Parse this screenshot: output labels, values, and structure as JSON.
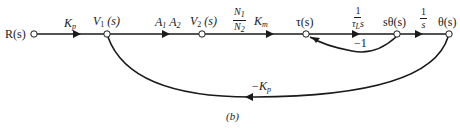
{
  "diagram": {
    "type": "signal-flow-graph",
    "caption": "(b)",
    "nodes": [
      {
        "id": "R",
        "label": "R(s)"
      },
      {
        "id": "V1",
        "label": "V",
        "sub": "1",
        "suffix": " (s)"
      },
      {
        "id": "V2",
        "label": "V",
        "sub": "2",
        "suffix": " (s)"
      },
      {
        "id": "tau",
        "label": "τ(s)"
      },
      {
        "id": "stheta",
        "label": "sθ(s)"
      },
      {
        "id": "theta",
        "label": "θ(s)"
      }
    ],
    "edges": [
      {
        "from": "R",
        "to": "V1",
        "gain": "K",
        "gain_sub": "p"
      },
      {
        "from": "V1",
        "to": "V2",
        "gain": "A",
        "gain_sub1": "1",
        "gain2": " A",
        "gain_sub2": "2"
      },
      {
        "from": "V2",
        "to": "tau",
        "gain_num": "N",
        "gain_num_sub": "1",
        "gain_den": "N",
        "gain_den_sub": "2",
        "gain_suffix": " K",
        "gain_suffix_sub": "m"
      },
      {
        "from": "tau",
        "to": "stheta",
        "gain_num": "1",
        "gain_den": "τ",
        "gain_den_sub": "L",
        "gain_den_suffix": "s"
      },
      {
        "from": "stheta",
        "to": "theta",
        "gain_num": "1",
        "gain_den": "s"
      },
      {
        "from": "stheta",
        "to": "tau",
        "gain": "−1"
      },
      {
        "from": "theta",
        "to": "V1",
        "gain": "−K",
        "gain_sub": "p"
      }
    ]
  }
}
